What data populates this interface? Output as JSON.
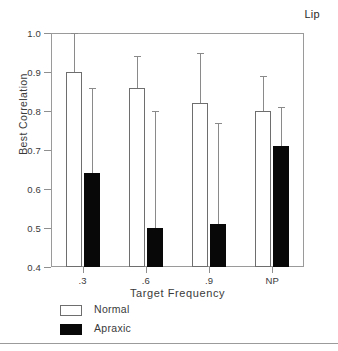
{
  "chart_data": {
    "type": "bar",
    "title": "Lip",
    "xlabel": "Target Frequency",
    "ylabel": "Best Correlation",
    "categories": [
      ".3",
      ".6",
      ".9",
      "NP"
    ],
    "ylim": [
      0.4,
      1.0
    ],
    "ytick_labels": [
      "0.4",
      "0.5",
      "0.6",
      "0.7",
      "0.8",
      "0.9",
      "1.0"
    ],
    "ytick_values": [
      0.4,
      0.5,
      0.6,
      0.7,
      0.8,
      0.9,
      1.0
    ],
    "grid": false,
    "legend_position": "below-axes-left",
    "series": [
      {
        "name": "Normal",
        "color": "#ffffff",
        "edge_color": "#6e6e6e",
        "values": [
          0.9,
          0.86,
          0.82,
          0.8
        ],
        "error_upper": [
          1.0,
          0.94,
          0.95,
          0.89
        ]
      },
      {
        "name": "Apraxic",
        "color": "#080808",
        "edge_color": "#080808",
        "values": [
          0.64,
          0.5,
          0.51,
          0.71
        ],
        "error_upper": [
          0.86,
          0.8,
          0.77,
          0.81
        ]
      }
    ]
  },
  "legend": {
    "items": [
      {
        "label": "Normal",
        "style": "normal"
      },
      {
        "label": "Apraxic",
        "style": "apraxic"
      }
    ]
  }
}
